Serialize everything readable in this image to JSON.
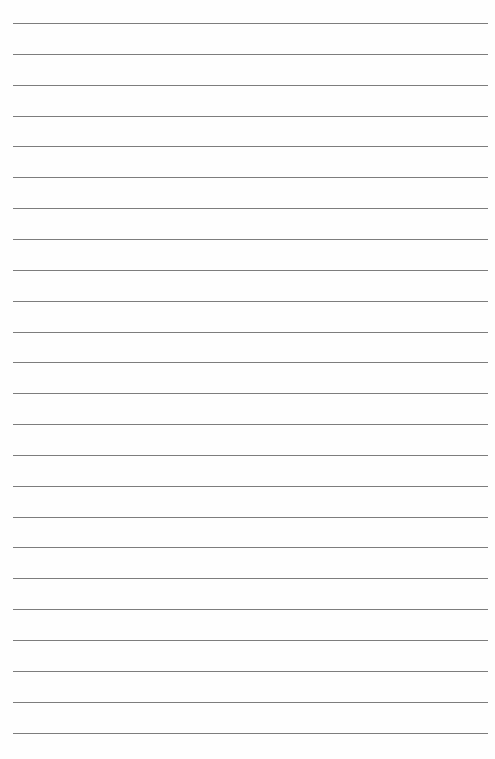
{
  "page": {
    "type": "lined-paper",
    "background_color": "#fefefe",
    "line_color": "#6f6f6f",
    "line_count": 24,
    "first_line_y": 23,
    "line_spacing": 30.85,
    "line_left": 13,
    "line_width": 475,
    "text_content": ""
  }
}
